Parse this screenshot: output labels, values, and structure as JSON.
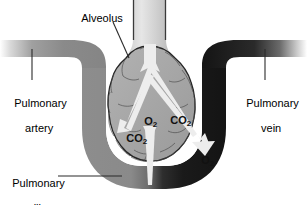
{
  "figure": {
    "width": 307,
    "height": 205,
    "background": "#ffffff"
  },
  "labels": {
    "alveolus": "Alveolus",
    "pulmonary_artery_line1": "Pulmonary",
    "pulmonary_artery_line2": "artery",
    "pulmonary_vein_line1": "Pulmonary",
    "pulmonary_vein_line2": "vein",
    "pulmonary_capillary_line1": "Pulmonary",
    "pulmonary_capillary_line2": "capillary"
  },
  "gas_labels": {
    "o2_upper": "O",
    "o2_upper_sub": "2",
    "co2_upper": "CO",
    "co2_upper_sub": "2",
    "co2_left": "CO",
    "co2_left_sub": "2",
    "o2_lower_right": "O",
    "o2_lower_right_sub": "2"
  },
  "colors": {
    "artery_gray": "#8a8a8a",
    "vein_black": "#1a1a1a",
    "alveolus_fill": "#a8a8a8",
    "alveolus_outline": "#2b2b2b",
    "arrow_white": "#ededed",
    "leader_line": "#2b2b2b",
    "background": "#ffffff",
    "text": "#000000"
  },
  "structures": [
    {
      "name": "bronchiole-duct",
      "description": "narrow airway tube entering alveolus from top"
    },
    {
      "name": "alveolus-sac",
      "description": "lobed gray air sac at center"
    },
    {
      "name": "pulmonary-artery-vessel",
      "description": "gray vessel entering from left, deoxygenated blood"
    },
    {
      "name": "pulmonary-vein-vessel",
      "description": "black vessel exiting to the right, oxygenated blood"
    },
    {
      "name": "capillary-loop",
      "description": "U-shaped vessel wrapping beneath the alveolus, gray to black"
    },
    {
      "name": "gas-exchange-arrows",
      "description": "white arrows showing O2 in and CO2 out"
    }
  ]
}
